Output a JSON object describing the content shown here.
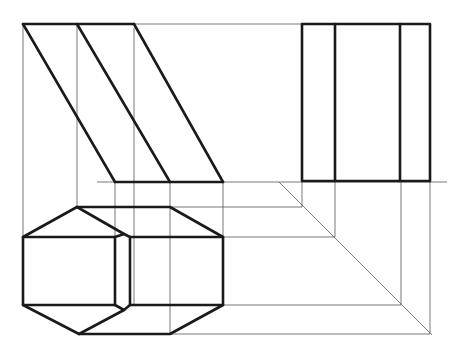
{
  "drawing": {
    "type": "orthographic projection",
    "views": [
      "front-view",
      "side-view",
      "top-view"
    ],
    "colors": {
      "background": "#ffffff",
      "line": "#1a1a1a",
      "construction": "#555555"
    }
  }
}
